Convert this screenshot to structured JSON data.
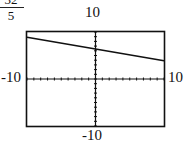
{
  "equation_fragment": {
    "numerator": "32",
    "denominator": "5"
  },
  "labels": {
    "ymax": "10",
    "ymin": "-10",
    "xmin": "-10",
    "xmax": "10"
  },
  "chart_data": {
    "type": "line",
    "title": "",
    "xlabel": "",
    "ylabel": "",
    "xlim": [
      -10,
      10
    ],
    "ylim": [
      -10,
      10
    ],
    "grid": false,
    "axes_ticks": "unit tick marks on both axes",
    "series": [
      {
        "name": "y = -x/4 + 32/5",
        "x": [
          -10,
          0,
          10
        ],
        "y": [
          8.9,
          6.4,
          3.9
        ]
      }
    ],
    "annotations": [
      "32/5"
    ]
  }
}
